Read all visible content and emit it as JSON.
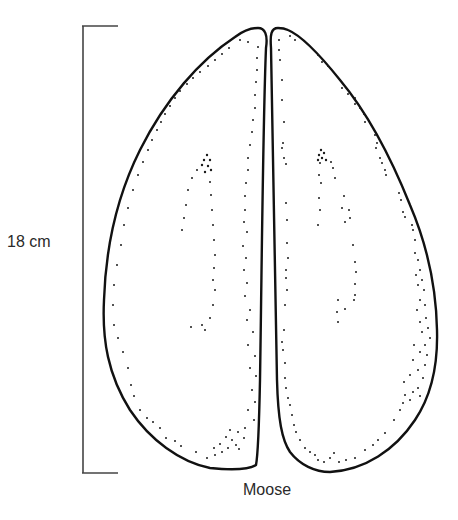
{
  "figure": {
    "caption": "Moose",
    "scale_bar": {
      "label": "18 cm",
      "x": 83,
      "y_top": 26,
      "y_bottom": 473,
      "tick_right": 118,
      "color": "#444444"
    },
    "outline_color": "#111111",
    "stipple_color": "#1a1a1a",
    "hooves": [
      {
        "name": "left-hoof",
        "side": "left"
      },
      {
        "name": "right-hoof",
        "side": "right"
      }
    ]
  }
}
